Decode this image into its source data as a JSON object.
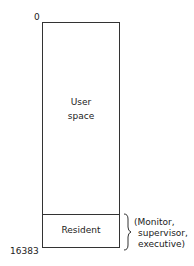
{
  "diagram": {
    "top_address": "0",
    "bottom_address": "16383",
    "regions": [
      {
        "label_line1": "User",
        "label_line2": "space"
      },
      {
        "label": "Resident"
      }
    ],
    "annotation": {
      "line1": "(Monitor,",
      "line2": "supervisor,",
      "line3": "executive)"
    }
  }
}
